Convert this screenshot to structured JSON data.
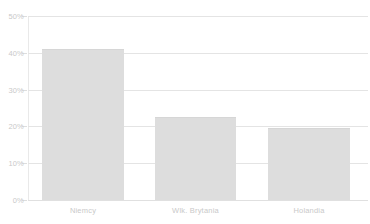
{
  "chart_data": {
    "type": "bar",
    "title": "",
    "subtitle": "",
    "xlabel": "",
    "ylabel": "",
    "categories": [
      "Niemcy",
      "Wlk. Brytania",
      "Holandia"
    ],
    "values": [
      41,
      22.5,
      19.5
    ],
    "value_labels": [
      "41%",
      "22.5%",
      "19.5%"
    ],
    "ylim": [
      0,
      50
    ],
    "ytick_values": [
      0,
      10,
      20,
      30,
      40,
      50
    ],
    "ytick_labels": [
      "0%",
      "10%",
      "20%",
      "30%",
      "40%",
      "50%"
    ],
    "grid": true,
    "legend": false,
    "legend_position": "none",
    "series": [
      {
        "name": "",
        "values": [
          41,
          22.5,
          19.5
        ]
      }
    ],
    "colors": {
      "bar_fill": "#dddddd",
      "bar_border": "#d6d6d6",
      "gridline": "#e4e4e4",
      "axis": "#e9e9e9",
      "tick_text": "#c9c9c9",
      "background": "#ffffff"
    }
  },
  "top_strip": {
    "text": ""
  }
}
